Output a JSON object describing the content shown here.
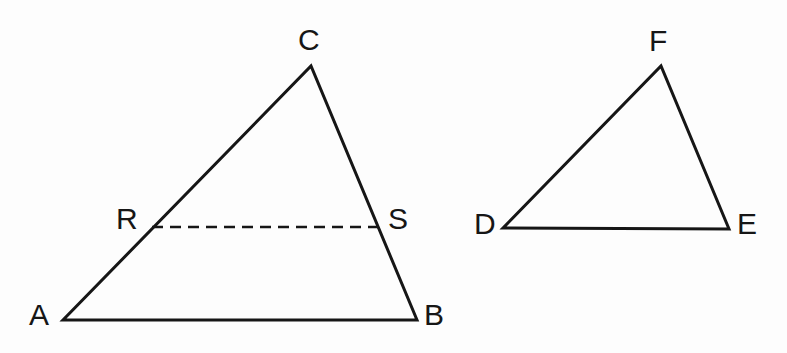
{
  "figure": {
    "background_color": "#fdfdfd",
    "stroke_color": "#161616",
    "label_color": "#161616",
    "solid_stroke_width": 3,
    "dashed_stroke_width": 2.6,
    "dash_pattern": "11 7",
    "width": 787,
    "height": 353
  },
  "shapes": {
    "triangle_abc": {
      "name": "triangle-abc",
      "vertices": {
        "A": {
          "x": 63,
          "y": 320
        },
        "B": {
          "x": 417,
          "y": 320
        },
        "C": {
          "x": 311,
          "y": 66
        }
      },
      "points_path": "63,320 417,320 311,66"
    },
    "triangle_def": {
      "name": "triangle-def",
      "vertices": {
        "D": {
          "x": 503,
          "y": 228
        },
        "E": {
          "x": 729,
          "y": 229
        },
        "F": {
          "x": 661,
          "y": 66
        }
      },
      "points_path": "503,228 729,229 661,66"
    },
    "segment_rs": {
      "name": "segment-rs",
      "style": "dashed",
      "from": {
        "label": "R",
        "x": 152,
        "y": 227
      },
      "to": {
        "label": "S",
        "x": 379,
        "y": 227
      }
    }
  },
  "labels": [
    {
      "id": "label-a",
      "text": "A",
      "x": 29,
      "y": 300
    },
    {
      "id": "label-b",
      "text": "B",
      "x": 424,
      "y": 300
    },
    {
      "id": "label-c",
      "text": "C",
      "x": 298,
      "y": 25
    },
    {
      "id": "label-r",
      "text": "R",
      "x": 116,
      "y": 204
    },
    {
      "id": "label-s",
      "text": "S",
      "x": 388,
      "y": 204
    },
    {
      "id": "label-d",
      "text": "D",
      "x": 474,
      "y": 209
    },
    {
      "id": "label-e",
      "text": "E",
      "x": 737,
      "y": 209
    },
    {
      "id": "label-f",
      "text": "F",
      "x": 649,
      "y": 26
    }
  ]
}
